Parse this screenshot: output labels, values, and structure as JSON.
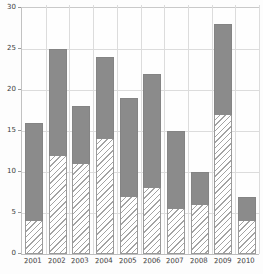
{
  "chart_data": {
    "type": "bar",
    "stacked": true,
    "title": "",
    "xlabel": "",
    "ylabel": "",
    "categories": [
      "2001",
      "2002",
      "2003",
      "2004",
      "2005",
      "2006",
      "2007",
      "2008",
      "2009",
      "2010"
    ],
    "series": [
      {
        "name": "bottom-segment-hatched",
        "style": "diagonal-hatch",
        "values": [
          4,
          12,
          11,
          14,
          7,
          8,
          5.5,
          6,
          17,
          4
        ]
      },
      {
        "name": "top-segment-solid-gray",
        "style": "solid",
        "values": [
          12,
          13,
          7,
          10,
          12,
          14,
          9.5,
          4,
          11,
          3
        ]
      }
    ],
    "totals": [
      16,
      25,
      18,
      24,
      19,
      22,
      15,
      10,
      28,
      7
    ],
    "ylim": [
      0,
      30
    ],
    "yticks": [
      0,
      5,
      10,
      15,
      20,
      25,
      30
    ],
    "grid": true,
    "legend_position": "none",
    "colors": {
      "solid_segment": "#8b8b8b",
      "hatch_line": "#a3a3a3",
      "hatch_background": "#ffffff",
      "gridline": "#dcdcdc",
      "axis_line": "#bdbdbd",
      "tick_text": "#3c3c3c",
      "background": "#fdfdfd"
    }
  }
}
